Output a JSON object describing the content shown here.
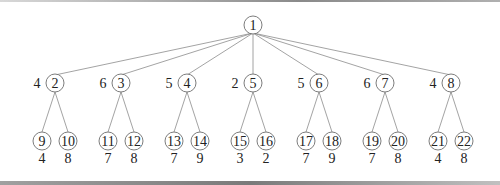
{
  "diagram": {
    "type": "tree",
    "root": {
      "id": "1",
      "x": 253,
      "y": 25
    },
    "level1": [
      {
        "id": "2",
        "x": 55,
        "weight": "4"
      },
      {
        "id": "3",
        "x": 121,
        "weight": "6"
      },
      {
        "id": "4",
        "x": 187,
        "weight": "5"
      },
      {
        "id": "5",
        "x": 253,
        "weight": "2"
      },
      {
        "id": "6",
        "x": 319,
        "weight": "5"
      },
      {
        "id": "7",
        "x": 385,
        "weight": "6"
      },
      {
        "id": "8",
        "x": 451,
        "weight": "4"
      }
    ],
    "level2": [
      {
        "id": "9",
        "parent": "2",
        "x": 42,
        "weight": "4"
      },
      {
        "id": "10",
        "parent": "2",
        "x": 68,
        "weight": "8"
      },
      {
        "id": "11",
        "parent": "3",
        "x": 108,
        "weight": "7"
      },
      {
        "id": "12",
        "parent": "3",
        "x": 134,
        "weight": "8"
      },
      {
        "id": "13",
        "parent": "4",
        "x": 174,
        "weight": "7"
      },
      {
        "id": "14",
        "parent": "4",
        "x": 200,
        "weight": "9"
      },
      {
        "id": "15",
        "parent": "5",
        "x": 240,
        "weight": "3"
      },
      {
        "id": "16",
        "parent": "5",
        "x": 266,
        "weight": "2"
      },
      {
        "id": "17",
        "parent": "6",
        "x": 306,
        "weight": "7"
      },
      {
        "id": "18",
        "parent": "6",
        "x": 332,
        "weight": "9"
      },
      {
        "id": "19",
        "parent": "7",
        "x": 372,
        "weight": "7"
      },
      {
        "id": "20",
        "parent": "7",
        "x": 398,
        "weight": "8"
      },
      {
        "id": "21",
        "parent": "8",
        "x": 438,
        "weight": "4"
      },
      {
        "id": "22",
        "parent": "8",
        "x": 464,
        "weight": "8"
      }
    ],
    "level1_y": 83,
    "level2_y": 141,
    "leaf_weight_y": 163,
    "radius": 9
  }
}
